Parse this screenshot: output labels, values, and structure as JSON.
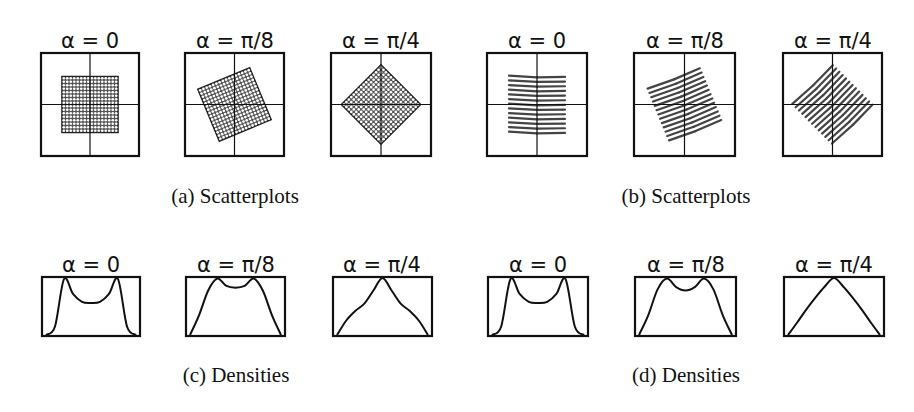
{
  "figure": {
    "colors": {
      "ink": "#111111",
      "scatter_fill": "#333333",
      "line_gray": "#444444"
    },
    "panels": [
      {
        "id": "a",
        "caption": "(a) Scatterplots",
        "kind": "scatter-lattice",
        "plots": [
          {
            "title": "α = 0",
            "alpha": 0
          },
          {
            "title": "α = π/8",
            "alpha": 0.3927
          },
          {
            "title": "α = π/4",
            "alpha": 0.7854
          }
        ]
      },
      {
        "id": "b",
        "caption": "(b) Scatterplots",
        "kind": "scatter-lines",
        "plots": [
          {
            "title": "α = 0",
            "alpha": 0
          },
          {
            "title": "α = π/8",
            "alpha": 0.3927
          },
          {
            "title": "α = π/4",
            "alpha": 0.7854
          }
        ]
      },
      {
        "id": "c",
        "caption": "(c) Densities",
        "kind": "density",
        "plots": [
          {
            "title": "α = 0",
            "alpha": 0
          },
          {
            "title": "α = π/8",
            "alpha": 0.3927
          },
          {
            "title": "α = π/4",
            "alpha": 0.7854
          }
        ]
      },
      {
        "id": "d",
        "caption": "(d) Densities",
        "kind": "density",
        "plots": [
          {
            "title": "α = 0",
            "alpha": 0
          },
          {
            "title": "α = π/8",
            "alpha": 0.3927
          },
          {
            "title": "α = π/4",
            "alpha": 0.7854
          }
        ]
      }
    ]
  },
  "chart_data": [
    {
      "type": "scatter",
      "title": "(a) Scatterplots",
      "subplots": [
        "α = 0",
        "α = π/8",
        "α = π/4"
      ],
      "description": "Uniform square lattice of points rotated by alpha; axes crosshair at origin",
      "rotation_rad": [
        0,
        0.3927,
        0.7854
      ],
      "grid": false
    },
    {
      "type": "scatter",
      "title": "(b) Scatterplots",
      "subplots": [
        "α = 0",
        "α = π/8",
        "α = π/4"
      ],
      "description": "Points arranged on ~13 parallel horizontal line segments (square support) rotated by alpha",
      "rotation_rad": [
        0,
        0.3927,
        0.7854
      ],
      "grid": false
    },
    {
      "type": "line",
      "title": "(c) Densities",
      "subplots": [
        "α = 0",
        "α = π/8",
        "α = π/4"
      ],
      "x": [
        0,
        0.1,
        0.2,
        0.3,
        0.4,
        0.5,
        0.6,
        0.7,
        0.8,
        0.9,
        1.0
      ],
      "series": [
        {
          "name": "α = 0",
          "values": [
            0.0,
            0.15,
            0.98,
            0.72,
            0.58,
            0.56,
            0.58,
            0.72,
            0.98,
            0.15,
            0.0
          ]
        },
        {
          "name": "α = π/8",
          "values": [
            0.0,
            0.35,
            0.78,
            0.99,
            0.86,
            0.83,
            0.86,
            0.99,
            0.78,
            0.35,
            0.0
          ]
        },
        {
          "name": "α = π/4",
          "values": [
            0.0,
            0.25,
            0.42,
            0.55,
            0.78,
            1.0,
            0.78,
            0.55,
            0.42,
            0.25,
            0.0
          ]
        }
      ],
      "ylim": [
        0,
        1
      ]
    },
    {
      "type": "line",
      "title": "(d) Densities",
      "subplots": [
        "α = 0",
        "α = π/8",
        "α = π/4"
      ],
      "x": [
        0,
        0.1,
        0.2,
        0.3,
        0.4,
        0.5,
        0.6,
        0.7,
        0.8,
        0.9,
        1.0
      ],
      "series": [
        {
          "name": "α = 0",
          "values": [
            0.0,
            0.15,
            0.98,
            0.72,
            0.58,
            0.56,
            0.58,
            0.72,
            0.98,
            0.15,
            0.0
          ]
        },
        {
          "name": "α = π/8",
          "values": [
            0.0,
            0.35,
            0.8,
            0.99,
            0.84,
            0.78,
            0.84,
            0.99,
            0.8,
            0.35,
            0.0
          ]
        },
        {
          "name": "α = π/4",
          "values": [
            0.0,
            0.22,
            0.45,
            0.66,
            0.85,
            1.0,
            0.85,
            0.66,
            0.45,
            0.22,
            0.0
          ]
        }
      ],
      "ylim": [
        0,
        1
      ]
    }
  ]
}
